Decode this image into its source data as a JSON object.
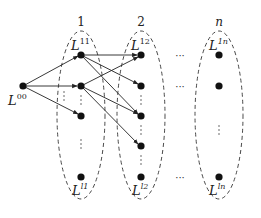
{
  "columns": [
    {
      "id": "col-1",
      "header": "1",
      "top_label_base": "L",
      "top_label_sup": "11",
      "bottom_label_base": "L",
      "bottom_label_sup": "l1"
    },
    {
      "id": "col-2",
      "header": "2",
      "top_label_base": "L",
      "top_label_sup": "12",
      "bottom_label_base": "L",
      "bottom_label_sup": "l2"
    },
    {
      "id": "col-n",
      "header": "n",
      "top_label_base": "L",
      "top_label_sup": "1n",
      "bottom_label_base": "L",
      "bottom_label_sup": "ln"
    }
  ],
  "source": {
    "label_base": "L",
    "label_sup": "00"
  },
  "ellipsis": {
    "horizontal": "···",
    "vertical": "⋮"
  },
  "colors": {
    "stroke": "#222222",
    "node": "#111111",
    "dash": "#333333"
  }
}
